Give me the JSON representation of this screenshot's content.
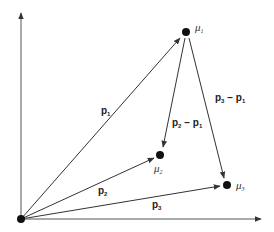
{
  "diagram": {
    "origin": {
      "x": 21,
      "y": 219
    },
    "axes": {
      "y_axis": {
        "from": [
          21,
          219
        ],
        "to": [
          21,
          12
        ]
      },
      "x_axis": {
        "from": [
          21,
          219
        ],
        "to": [
          262,
          219
        ]
      }
    },
    "points": [
      {
        "id": "mu1",
        "symbol": "μ",
        "subscript": "1",
        "x": 186,
        "y": 32
      },
      {
        "id": "mu2",
        "symbol": "μ",
        "subscript": "2",
        "x": 160,
        "y": 155
      },
      {
        "id": "mu3",
        "symbol": "μ",
        "subscript": "3",
        "x": 227,
        "y": 185
      }
    ],
    "vectors": [
      {
        "id": "p1",
        "label": "p",
        "subscript": "1",
        "from": "origin",
        "to": "mu1"
      },
      {
        "id": "p2",
        "label": "p",
        "subscript": "2",
        "from": "origin",
        "to": "mu2"
      },
      {
        "id": "p3",
        "label": "p",
        "subscript": "3",
        "from": "origin",
        "to": "mu3"
      },
      {
        "id": "p2-p1",
        "label": "p₂ − p₁",
        "from": "mu1",
        "to": "mu2"
      },
      {
        "id": "p3-p1",
        "label": "p₃ − p₁",
        "from": "mu1",
        "to": "mu3"
      }
    ],
    "labels": {
      "p1": {
        "main": "p",
        "sub": "1"
      },
      "p2": {
        "main": "p",
        "sub": "2"
      },
      "p3": {
        "main": "p",
        "sub": "3"
      },
      "p2_minus_p1": {
        "a": "p",
        "a_sub": "2",
        "op": " − ",
        "b": "p",
        "b_sub": "1"
      },
      "p3_minus_p1": {
        "a": "p",
        "a_sub": "3",
        "op": " − ",
        "b": "p",
        "b_sub": "1"
      },
      "mu1": {
        "main": "μ",
        "sub": "1"
      },
      "mu2": {
        "main": "μ",
        "sub": "2"
      },
      "mu3": {
        "main": "μ",
        "sub": "3"
      }
    },
    "colors": {
      "line": "#333333",
      "point": "#111111",
      "background": "#ffffff"
    }
  }
}
